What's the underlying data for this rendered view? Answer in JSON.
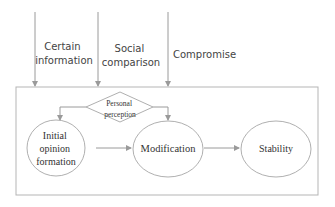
{
  "diagram": {
    "inputs": [
      {
        "label_lines": [
          "Certain",
          "information"
        ]
      },
      {
        "label_lines": [
          "Social",
          "comparison"
        ]
      },
      {
        "label_lines": [
          "Compromise"
        ]
      }
    ],
    "decision": {
      "label_lines": [
        "Personal",
        "perception"
      ]
    },
    "stages": [
      {
        "label_lines": [
          "Initial",
          "opinion",
          "formation"
        ]
      },
      {
        "label_lines": [
          "Modification"
        ]
      },
      {
        "label_lines": [
          "Stability"
        ]
      }
    ],
    "colors": {
      "line": "#9a9a9a",
      "box": "#b5b5b5",
      "text": "#333333"
    }
  }
}
